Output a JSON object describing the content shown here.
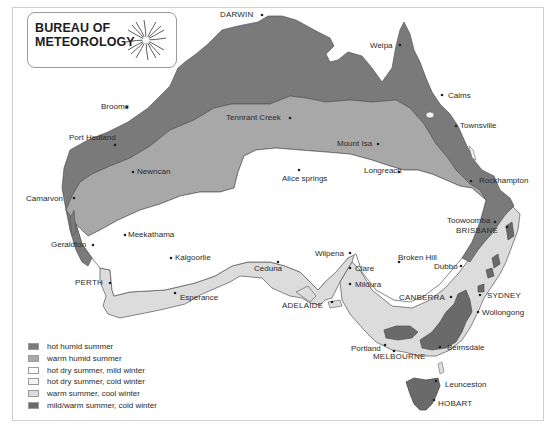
{
  "logo": {
    "line1": "BUREAU OF",
    "line2": "METEOROLOGY",
    "icon": "spiral-swirl-icon"
  },
  "colors": {
    "hot_humid": "#7a7a7a",
    "warm_humid": "#a8a8a8",
    "hot_dry_mild": "#ffffff",
    "hot_dry_cold": "#f3f3f3",
    "warm_cool": "#dcdcdc",
    "mild_cold": "#6a6a6a",
    "outline": "#555555"
  },
  "legend": [
    {
      "label": "hot humid summer",
      "color": "#7a7a7a"
    },
    {
      "label": "warm humid summer",
      "color": "#a8a8a8"
    },
    {
      "label": "hot dry summer, mild winter",
      "color": "#ffffff"
    },
    {
      "label": "hot dry summer, cold winter",
      "color": "#f3f3f3"
    },
    {
      "label": "warm summer, cool winter",
      "color": "#dcdcdc"
    },
    {
      "label": "mild/warm summer, cold winter",
      "color": "#6a6a6a"
    }
  ],
  "places": {
    "darwin": "DARWIN",
    "weipa": "Weipa",
    "cairns": "Caims",
    "broome": "Broome",
    "tennant_creek": "Tennrant Creek",
    "townsville": "Townsville",
    "port_hedland": "Port Hedland",
    "mount_isa": "Mount Isa",
    "newman": "Newncan",
    "longreach": "Longreach",
    "rockhampton": "Rockhampton",
    "alice_springs": "Alice springs",
    "carnarvon": "Camarvon",
    "toowoomba": "Toowoomba",
    "brisbane": "BRISBANE",
    "meekatharra": "Meekathama",
    "geraldton": "Geraldton",
    "wilpena": "Wilpena",
    "broken_hill": "Broken Hill",
    "kalgoorlie": "Kalgoorlie",
    "dubbo": "Dubbo",
    "clare": "Clare",
    "perth": "PERTH",
    "ceduna": "Ceduna",
    "mildura": "Mildura",
    "sydney": "SYDNEY",
    "esperance": "Esperance",
    "canberra": "CANBERRA",
    "adelaide": "ADELAIDE",
    "wollongong": "Wollongong",
    "portland": "Portland",
    "beimsdale": "Beimsdale",
    "melbourne": "MELBOURNE",
    "launceston": "Leunceston",
    "hobart": "HOBART"
  }
}
